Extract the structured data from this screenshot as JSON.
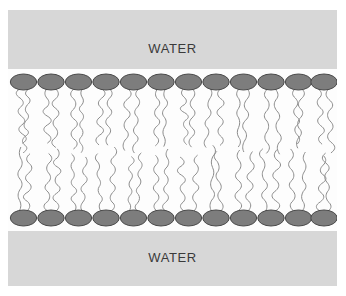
{
  "figure": {
    "type": "diagram",
    "canvas": {
      "width": 346,
      "height": 296
    },
    "background_color": "#ffffff",
    "panel": {
      "x": 8,
      "y": 10,
      "width": 329,
      "height": 276,
      "fill_color": "#d7d7d7"
    }
  },
  "labels": {
    "water_top": "WATER",
    "water_bottom": "WATER",
    "text_color": "#3a3a3a",
    "font_size_px": 13
  },
  "membrane": {
    "region": {
      "x": 0,
      "y": 59,
      "width": 329,
      "height": 162
    },
    "fill_color": "#fdfdfd",
    "head_color": "#7d7d7d",
    "head_stroke_color": "#4a4a4a",
    "tail_color": "#8c8c8c",
    "tail_stroke_width": 1,
    "head_count_per_leaflet": 12,
    "tails_per_head": 2,
    "head_rx": 13.2,
    "head_ry": 8.0,
    "leaflets": [
      {
        "name": "upper-leaflet",
        "head_center_y": 13,
        "tail_direction": "down",
        "tail_length": 62
      },
      {
        "name": "lower-leaflet",
        "head_center_y": 149,
        "tail_direction": "up",
        "tail_length": 62
      }
    ],
    "head_centers_x": [
      15.5,
      43.0,
      70.5,
      98.0,
      125.5,
      153.0,
      180.5,
      208.0,
      235.5,
      263.0,
      290.5,
      316.0
    ]
  }
}
